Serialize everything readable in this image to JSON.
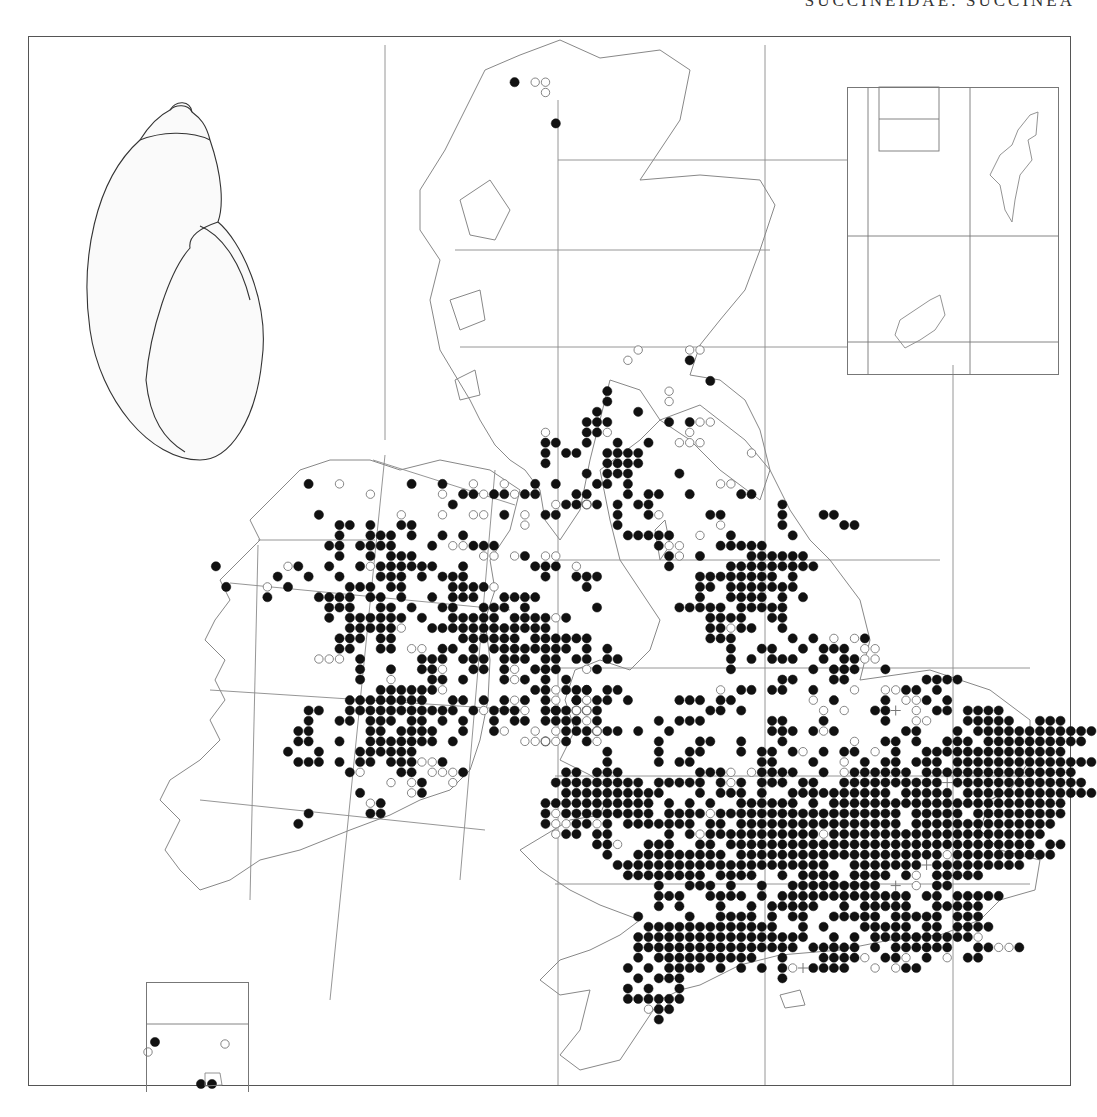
{
  "page": {
    "header": "SUCCINEIDAE: SUCCINEA"
  },
  "legend_symbols": {
    "F": "filled-circle-record",
    "O": "open-circle-record",
    "+": "plus-record"
  },
  "colors": {
    "ink": "#111111",
    "line": "#777777",
    "coast": "#888888"
  },
  "lattice": {
    "x0": 30.5,
    "y0": 41,
    "pitch": 10.3
  },
  "records": [
    {
      "r": 4,
      "c": 47,
      "s": "F.OO"
    },
    {
      "r": 5,
      "c": 50,
      "s": "O"
    },
    {
      "r": 8,
      "c": 51,
      "s": "F"
    },
    {
      "r": 30,
      "c": 59,
      "s": "O"
    },
    {
      "r": 30,
      "c": 64,
      "s": "OO"
    },
    {
      "r": 31,
      "c": 58,
      "s": "O.....F"
    },
    {
      "r": 33,
      "c": 66,
      "s": "F"
    },
    {
      "r": 34,
      "c": 62,
      "s": "O"
    },
    {
      "r": 35,
      "c": 62,
      "s": "O"
    },
    {
      "r": 34,
      "c": 56,
      "s": "F"
    },
    {
      "r": 35,
      "c": 56,
      "s": "F"
    },
    {
      "r": 36,
      "c": 55,
      "s": "F...F"
    },
    {
      "r": 37,
      "c": 54,
      "s": "FFF.....F.FOO"
    },
    {
      "r": 38,
      "c": 50,
      "s": "O...FFO.......O"
    },
    {
      "r": 39,
      "c": 50,
      "s": "FF..F..F..F..OOO"
    },
    {
      "r": 40,
      "c": 50,
      "s": "F.FF..FFFF..........O"
    },
    {
      "r": 41,
      "c": 50,
      "s": "F.....FFFF"
    },
    {
      "r": 42,
      "c": 54,
      "s": "F.FFF....F"
    },
    {
      "r": 43,
      "c": 55,
      "s": "FF.F........OO"
    },
    {
      "r": 44,
      "c": 53,
      "s": "FF...F.FF..F....FF"
    },
    {
      "r": 45,
      "c": 54,
      "s": "FF.F.FF............F"
    },
    {
      "r": 46,
      "c": 57,
      "s": "F..FO....FF.....F...FF"
    },
    {
      "r": 47,
      "c": 57,
      "s": "F.........O.....F.....FF"
    },
    {
      "r": 48,
      "c": 58,
      "s": "FFFFF..O..F.....F"
    },
    {
      "r": 49,
      "c": 61,
      "s": "FOO...FFFFF"
    },
    {
      "r": 50,
      "c": 62,
      "s": "FO.F....FFFFFF"
    },
    {
      "r": 51,
      "c": 62,
      "s": "F.....FFFFFFFFF"
    },
    {
      "r": 52,
      "c": 65,
      "s": "FFFFFFFF.F"
    },
    {
      "r": 53,
      "c": 65,
      "s": "FF.FFFFFFF"
    },
    {
      "r": 54,
      "c": 65,
      "s": "F..FFFF.F.F"
    },
    {
      "r": 55,
      "c": 55,
      "s": "F.......FFFFF.FFFFF"
    },
    {
      "r": 56,
      "c": 66,
      "s": "FFFF..FF"
    },
    {
      "r": 57,
      "c": 66,
      "s": "FFOFF..F"
    },
    {
      "r": 58,
      "c": 66,
      "s": "FFF.....F.F.O.OF"
    },
    {
      "r": 59,
      "c": 68,
      "s": "F..FF..F.FFF.OO"
    },
    {
      "r": 60,
      "c": 68,
      "s": "F.F.FFF..F.FFOO"
    },
    {
      "r": 61,
      "c": 68,
      "s": "F.......F.FFF..F"
    },
    {
      "r": 62,
      "c": 73,
      "s": "FF...FF.......FFFF"
    },
    {
      "r": 63,
      "c": 54,
      "s": "F.F..........O.FF.FF..F...O..OOFF.F"
    },
    {
      "r": 64,
      "c": 51,
      "s": "O.FOFF.F....FFF.FF.......O.F....F.OOF.F"
    },
    {
      "r": 65,
      "c": 51,
      "s": "FFFFF..........FF.F.......O.O..FF+.O.FF.FFFF"
    },
    {
      "r": 66,
      "c": 52,
      "s": "FF.......F.FFF......FF...F.....F..OO...FFFFF..FFF"
    },
    {
      "r": 67,
      "c": 51,
      "s": "O.F.FFF.F..F.........FFF.FOF......FF...F.FFFFFFFFFFFF"
    },
    {
      "r": 68,
      "c": 50,
      "s": "F.F........F...FF..F...F......O..FF.F..FFF.FFFFFFFFFF"
    },
    {
      "r": 69,
      "c": 56,
      "s": "F....F..FF...F.FF.FO.F.FF.O.F..FFFFFFFFFFFFFF"
    },
    {
      "r": 70,
      "c": 56,
      "s": "F....F.FF......FF...F..O.F.FF.FFF.FFFFFFFFFFFFFF"
    },
    {
      "r": 71,
      "c": 52,
      "s": "FF.FFF.......FFFO.OFFFF..F.OFFFFFF.FFFFFFFFFFFFFFF"
    },
    {
      "r": 72,
      "c": 51,
      "s": "FFFFFFFFF.FFFFF.FOF.FFF.FF..FFFFFFFFFF+FFFFFFFFFFFFF"
    },
    {
      "r": 73,
      "c": 52,
      "s": "FFFFFFFFFF...F.FFF.F..FFFFFFFFFF.FFFFF.FFFFFFFFFFFFF"
    },
    {
      "r": 74,
      "c": 50,
      "s": "FFFFFFFFFFF.F.F.F..FFFFFF.F.FFFFFFFFFFFFFFFFFFFFFFF"
    },
    {
      "r": 75,
      "c": 50,
      "s": "FOFFFFFFFFF.FFFFOFFFFFFFFFFFFFFFFFF.FFFFF.FFFFFFFFF"
    },
    {
      "r": 76,
      "c": 50,
      "s": "FOOFFOF.FFFFFFF.FF.FFFFFFFFFFFFFFFF.FFFFFFFFFFFFFF"
    },
    {
      "r": 77,
      "c": 51,
      "s": "OFF.FF.....F.FOFFFFFFFFFFFOFFFFFFFFFFFFFFFFFFFFF"
    },
    {
      "r": 78,
      "c": 55,
      "s": "FFO..FFF..FF.FFFFFFFFFFFFFFFFFFFFFFFFFFFFFF.FF"
    },
    {
      "r": 79,
      "c": 56,
      "s": "F..FFFFFFFFF.FFFFFFFFFFFFFFFFFFFFOFFFFFFFFFF"
    },
    {
      "r": 80,
      "c": 57,
      "s": "FFFFFFFFFFFFFFFFFFFFF..FFFFFFF+FFFFFFFFF"
    },
    {
      "r": 81,
      "c": 58,
      "s": "FFFFFFFF.FFFF..F.FFFF.FFFF.FO.FFFFF"
    },
    {
      "r": 82,
      "c": 61,
      "s": "F..FFF.F..F..FFFFFFFFF.+.O.FF"
    },
    {
      "r": 83,
      "c": 61,
      "s": "FFF..FFFF.F.FFFFFFFFFFFFF.FF.FFFFF"
    },
    {
      "r": 84,
      "c": 61,
      "s": "F.F...F..F.FFFFF..F.FFFFF..FFFFF"
    },
    {
      "r": 85,
      "c": 59,
      "s": "F....F..FFFF.F.FF..FFFFF.FFFFF.FFF"
    },
    {
      "r": 86,
      "c": 60,
      "s": "FFFFFFFFFFFFF..F.F...FFFFF.FF.FFFF"
    },
    {
      "r": 87,
      "c": 59,
      "s": "FFFFFFFFFFFFFFFFF..F.F.FFFFFFFFFFO"
    },
    {
      "r": 88,
      "c": 59,
      "s": "FFFFFFFFFFFFFFFF.FFFFF.F.FFFFFF..FFOOF"
    },
    {
      "r": 89,
      "c": 59,
      "s": "F.FFFFFFFFFF..F...FFFFO.FFO.F.O.FF"
    },
    {
      "r": 90,
      "c": 58,
      "s": "F.F.FFFF.F.F.F.FO+FFFF..O.OFF"
    },
    {
      "r": 91,
      "c": 59,
      "s": "F.FFF.........F"
    },
    {
      "r": 92,
      "c": 58,
      "s": "F.F..F"
    },
    {
      "r": 93,
      "c": 58,
      "s": "FFFFFF"
    },
    {
      "r": 94,
      "c": 60,
      "s": "OFF"
    },
    {
      "r": 95,
      "c": 61,
      "s": "F"
    },
    {
      "r": 43,
      "c": 27,
      "s": "F..O......F..F..O..O..F.F"
    },
    {
      "r": 44,
      "c": 33,
      "s": "O......O.FFOFFOFF"
    },
    {
      "r": 45,
      "c": 41,
      "s": "F.........OFFO"
    },
    {
      "r": 46,
      "c": 28,
      "s": "F.......O...O..OO.F.O.FF"
    },
    {
      "r": 47,
      "c": 30,
      "s": "FF.F..FF..........O"
    },
    {
      "r": 48,
      "c": 30,
      "s": "F..FFF.F..F.F"
    },
    {
      "r": 49,
      "c": 29,
      "s": "FF.FFFF...F.OOFFF"
    },
    {
      "r": 50,
      "c": 30,
      "s": "F..F.FFF......OO.OF.OO"
    },
    {
      "r": 51,
      "c": 25,
      "s": "OF..F..FOFFFFFF..F......FFF.O"
    },
    {
      "r": 52,
      "c": 24,
      "s": "F..F..F...FFF.F.FFF.......F..FFF"
    },
    {
      "r": 53,
      "c": 23,
      "s": "O.F.....FFF.FF....FFFFO........F"
    },
    {
      "r": 54,
      "c": 23,
      "s": "F....FFFF.FF.F..F.FFF..FFFF"
    },
    {
      "r": 55,
      "c": 29,
      "s": "FFF..FF.F..FF..FFF.F"
    },
    {
      "r": 56,
      "c": 29,
      "s": "F.FFFFFF.F..FFFFF.FFFFOF"
    },
    {
      "r": 57,
      "c": 31,
      "s": "FFFFFO..FFFFFFFFFFFF"
    },
    {
      "r": 58,
      "c": 30,
      "s": "FFF.FF......FFFFFF.FFFFFF"
    },
    {
      "r": 59,
      "c": 30,
      "s": "FF..FF.OO.FF.F.FFFFFFFF.F.F"
    },
    {
      "r": 60,
      "c": 28,
      "s": "OOO.F.....FFF.FFF.FFF.FF.FF.FF"
    },
    {
      "r": 61,
      "c": 32,
      "s": "F..F..FFO..FF.FO.FFF..OF"
    },
    {
      "r": 62,
      "c": 32,
      "s": "F..O...FF.F...FOF.F.F"
    },
    {
      "r": 63,
      "c": 34,
      "s": "FFFFFFO........FFOFFF..F"
    },
    {
      "r": 64,
      "c": 31,
      "s": "FFFFFFFF..FF.F.FOF.F..FO"
    },
    {
      "r": 65,
      "c": 27,
      "s": "FF..FFFFFFFFFFF.FOFFFO.FF.OO"
    },
    {
      "r": 66,
      "c": 27,
      "s": "F..FF.FFF.FF.F.F..F.FF.FF..OF"
    },
    {
      "r": 67,
      "c": 26,
      "s": "FF.....FF.FFFF..F..FO..O..F.FO"
    },
    {
      "r": 68,
      "c": 26,
      "s": "FF..F..FFFFFFF.F......OOOO..FO"
    },
    {
      "r": 69,
      "c": 25,
      "s": "F..F...FFFFFF"
    },
    {
      "r": 70,
      "c": 26,
      "s": "FFF.F.FF.FFFOOF"
    },
    {
      "r": 71,
      "c": 31,
      "s": "FO...FF.OOOF"
    },
    {
      "r": 72,
      "c": 31,
      "s": "....O.OF..O"
    },
    {
      "r": 73,
      "c": 32,
      "s": "F....OF"
    },
    {
      "r": 74,
      "c": 33,
      "s": "OF"
    },
    {
      "r": 75,
      "c": 27,
      "s": "F.....FF"
    },
    {
      "r": 76,
      "c": 26,
      "s": "F"
    },
    {
      "r": 51,
      "c": 18,
      "s": "F"
    },
    {
      "r": 53,
      "c": 19,
      "s": "F"
    }
  ],
  "inset_records": [
    {
      "x": 155,
      "y": 1042,
      "sym": "F"
    },
    {
      "x": 148,
      "y": 1052,
      "sym": "O"
    },
    {
      "x": 201,
      "y": 1084,
      "sym": "F"
    },
    {
      "x": 212,
      "y": 1084,
      "sym": "F"
    },
    {
      "x": 225,
      "y": 1044,
      "sym": "O"
    }
  ],
  "grid_lines": [
    [
      385,
      45,
      385,
      440
    ],
    [
      558,
      100,
      558,
      1085
    ],
    [
      765,
      45,
      765,
      1085
    ],
    [
      953,
      365,
      953,
      1085
    ],
    [
      455,
      250,
      770,
      250
    ],
    [
      558,
      160,
      848,
      160
    ],
    [
      460,
      347,
      848,
      347
    ],
    [
      555,
      560,
      940,
      560
    ],
    [
      555,
      668,
      1030,
      668
    ],
    [
      555,
      776,
      1030,
      776
    ],
    [
      555,
      884,
      1030,
      884
    ],
    [
      373,
      460,
      515,
      505
    ],
    [
      258,
      540,
      375,
      540
    ],
    [
      230,
      583,
      510,
      610
    ],
    [
      210,
      690,
      520,
      710
    ],
    [
      200,
      800,
      485,
      830
    ],
    [
      385,
      455,
      330,
      1000
    ],
    [
      495,
      470,
      460,
      880
    ],
    [
      258,
      545,
      250,
      900
    ]
  ]
}
